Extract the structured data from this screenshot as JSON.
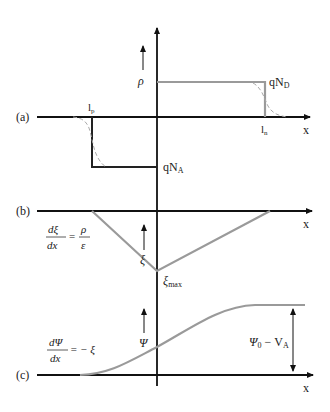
{
  "figure": {
    "colors": {
      "axis": "#111111",
      "ideal_profile": "#222222",
      "gray_profile": "#9a9a9a",
      "dashed_profile": "#a8a8a8"
    },
    "panels": [
      {
        "id": "a",
        "label": "(a)",
        "quantity": "ρ",
        "x_axis_label": "x",
        "annotations": {
          "donor": "qN",
          "donor_sub": "D",
          "acceptor": "qN",
          "acceptor_sub": "A",
          "lp": "l",
          "lp_sub": "p",
          "ln": "l",
          "ln_sub": "n"
        }
      },
      {
        "id": "b",
        "label": "(b)",
        "quantity": "ξ",
        "x_axis_label": "x",
        "equation": {
          "num_left": "dξ",
          "den_left": "dx",
          "equals": "=",
          "num_right": "ρ",
          "den_right": "ε"
        },
        "annotations": {
          "peak": "ξ",
          "peak_sub": "max"
        }
      },
      {
        "id": "c",
        "label": "(c)",
        "quantity": "Ψ",
        "x_axis_label": "x",
        "equation": {
          "num_left": "dΨ",
          "den_left": "dx",
          "rhs": "= − ξ"
        },
        "annotations": {
          "barrier": "Ψ",
          "barrier_sub0": "0",
          "barrier_rest": " − V",
          "barrier_sub": "A"
        }
      }
    ]
  }
}
